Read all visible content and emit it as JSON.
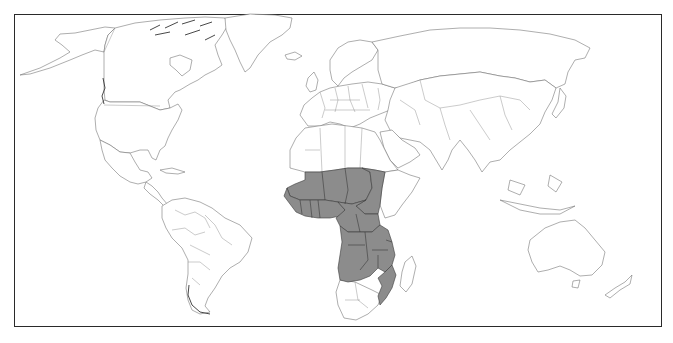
{
  "map": {
    "type": "world-choropleth",
    "projection": "equirectangular-like world outline",
    "highlight_color": "#8c8c8c",
    "highlight_border_color": "#3a3a3a",
    "base_fill_color": "#ffffff",
    "outline_color": "#6a6a6a",
    "frame_color": "#2a2a2a",
    "highlighted_region": "Sub-Saharan Africa",
    "highlighted_countries": [
      "Mali",
      "Niger",
      "Chad",
      "Sudan",
      "Senegal",
      "Gambia",
      "Guinea-Bissau",
      "Guinea",
      "Sierra Leone",
      "Liberia",
      "Côte d'Ivoire",
      "Burkina Faso",
      "Ghana",
      "Togo",
      "Benin",
      "Nigeria",
      "Cameroon",
      "Central African Republic",
      "Equatorial Guinea",
      "Gabon",
      "Congo",
      "Democratic Republic of the Congo",
      "Uganda",
      "Rwanda",
      "Burundi",
      "Tanzania",
      "Angola",
      "Zambia",
      "Malawi",
      "Mozambique"
    ],
    "legend": null,
    "title": null
  }
}
